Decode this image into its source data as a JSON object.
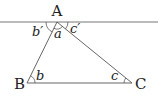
{
  "diagram": {
    "type": "triangle with parallel line",
    "stroke_color": "#555555",
    "vertices": [
      {
        "name": "A",
        "label": "A"
      },
      {
        "name": "B",
        "label": "B"
      },
      {
        "name": "C",
        "label": "C"
      }
    ],
    "angles": {
      "a": "a",
      "b": "b",
      "c": "c",
      "b_prime": "b′",
      "c_prime": "c′"
    }
  }
}
